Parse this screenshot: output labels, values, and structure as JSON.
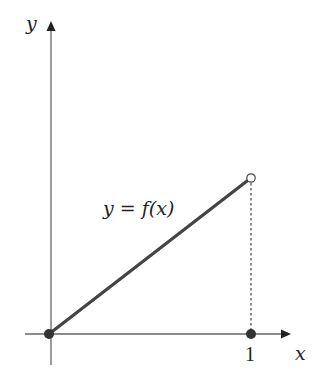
{
  "diagram": {
    "axes": {
      "x_label": "x",
      "y_label": "y",
      "color": "#666666"
    },
    "function_label": "y = f(x)",
    "tick_labels": [
      {
        "value": "1",
        "position": "x"
      }
    ],
    "segment": {
      "from": [
        0,
        0
      ],
      "to": [
        1,
        1
      ],
      "color": "#444444",
      "start_point": "closed",
      "end_point": "open"
    },
    "points": [
      {
        "name": "origin",
        "x": 0,
        "y": 0,
        "style": "filled"
      },
      {
        "name": "endpoint-open",
        "x": 1,
        "y": 1,
        "style": "open"
      },
      {
        "name": "x-one",
        "x": 1,
        "y": 0,
        "style": "filled"
      }
    ],
    "dashed_guide": {
      "from": [
        1,
        1
      ],
      "to": [
        1,
        0
      ]
    }
  }
}
